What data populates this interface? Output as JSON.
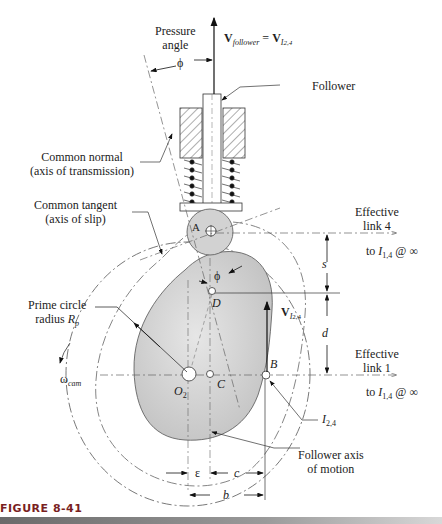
{
  "figure": {
    "caption_label": "FIGURE 8-41",
    "type": "cam-follower mechanism diagram (roller follower, offset)"
  },
  "labels": {
    "pressure_angle": [
      "Pressure",
      "angle"
    ],
    "phi_top": "ϕ",
    "velocity_eq": {
      "v": "V",
      "follower_sub": "follower",
      "eq": " = ",
      "v2": "V",
      "i_sub": "I",
      "i_sub2": "2,4"
    },
    "follower": "Follower",
    "common_normal": [
      "Common normal",
      "(axis of transmission)"
    ],
    "common_tangent": [
      "Common tangent",
      "(axis of slip)"
    ],
    "point_a": "A",
    "effective_link_4": [
      "Effective",
      "link  4"
    ],
    "to_i14_top": {
      "pre": "to ",
      "i": "I",
      "sub": "1,4",
      "post": " @ ∞"
    },
    "s": "s",
    "phi_mid": "ϕ",
    "point_d": "D",
    "v_i24": {
      "v": "V",
      "i": "I",
      "sub": "2,4"
    },
    "d": "d",
    "prime_circle": {
      "line1": "Prime circle",
      "line2_pre": "radius ",
      "r": "R",
      "r_sub": "p"
    },
    "omega": {
      "w": "ω",
      "sub": "cam"
    },
    "point_o2": {
      "o": "O",
      "sub": "2"
    },
    "point_c": "C",
    "point_b": "B",
    "effective_link_1": [
      "Effective",
      "link  1"
    ],
    "to_i14_bottom": {
      "pre": "to ",
      "i": "I",
      "sub": "1,4",
      "post": " @ ∞"
    },
    "i24": {
      "i": "I",
      "sub": "2,4"
    },
    "follower_axis": [
      "Follower axis",
      "of motion"
    ],
    "epsilon": "ε",
    "c": "c",
    "b": "b"
  },
  "colors": {
    "cam_fill": "#cfcfcf",
    "line": "#222222",
    "caption": "#7a1f1f"
  }
}
